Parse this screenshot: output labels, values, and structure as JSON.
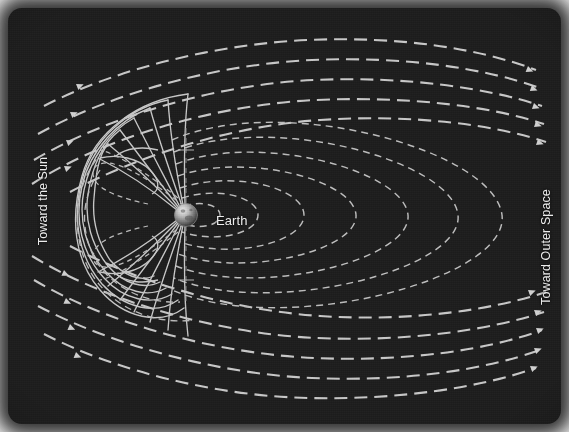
{
  "figure": {
    "type": "scientific-diagram",
    "background_color": "#1d1d1d",
    "line_color": "#c9c9c9",
    "label_color": "#ececec"
  },
  "labels": {
    "sun": "Toward the Sun",
    "space": "Toward Outer Space",
    "earth": "Earth"
  },
  "body": {
    "name": "Earth",
    "center_x": 178,
    "center_y": 207,
    "radius": 11,
    "highlight_color": "#efefef",
    "shadow_color": "#3c3c3c"
  },
  "diagram_data": {
    "type": "vector-field-diagram",
    "description": "Solar wind flowing from left (Sun) to right (outer space) past Earth's magnetosphere; closed dipole field lines near Earth, open swept-back field lines forming the magnetotail.",
    "flow_direction": "left-to-right",
    "solar_wind_streamlines_top": 5,
    "solar_wind_streamlines_bottom": 5,
    "arrowheads_inflow_top": 4,
    "arrowheads_inflow_bottom": 4,
    "arrowheads_outflow_top": 5,
    "arrowheads_outflow_bottom": 5,
    "closed_dipole_loops": 6,
    "open_polar_field_lines": 14,
    "neutral_points": 2,
    "line_styles": {
      "solar_wind": "dashed",
      "magnetopause": "solid",
      "dipole_field": "dashed"
    }
  }
}
